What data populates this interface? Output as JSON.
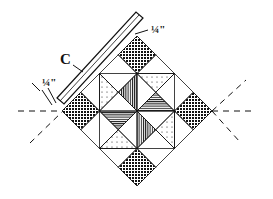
{
  "diagram": {
    "labels": {
      "strip": "C",
      "seam_top": "¼\"",
      "seam_left": "¼\""
    },
    "colors": {
      "ink": "#111111",
      "background": "#ffffff"
    },
    "blocks": {
      "grid": 4,
      "crosshatch_cells": [
        [
          0,
          0
        ],
        [
          3,
          0
        ],
        [
          0,
          3
        ],
        [
          3,
          3
        ]
      ],
      "triangles": [
        {
          "pattern": "dots",
          "pos": "upper-right-top"
        },
        {
          "pattern": "vlines",
          "pos": "upper-left-inner"
        },
        {
          "pattern": "dots",
          "pos": "left-upper"
        },
        {
          "pattern": "hlines",
          "pos": "upper-right-inner"
        },
        {
          "pattern": "hlines",
          "pos": "lower-left-inner"
        },
        {
          "pattern": "vlines",
          "pos": "lower-right-inner"
        },
        {
          "pattern": "dots",
          "pos": "right-lower"
        },
        {
          "pattern": "dots",
          "pos": "bottom-left"
        }
      ]
    }
  }
}
